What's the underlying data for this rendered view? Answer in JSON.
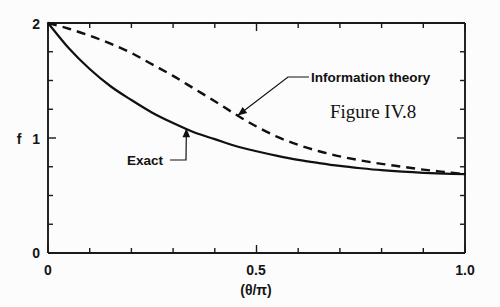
{
  "figure": {
    "caption": "Figure IV.8",
    "background_color": "#fcfcfc",
    "ink_color": "#111111"
  },
  "chart_data": {
    "type": "line",
    "title": "",
    "subtitle": "",
    "xlabel": "(θ/π)",
    "ylabel": "f",
    "xlim": [
      0,
      1.0
    ],
    "ylim": [
      0,
      2
    ],
    "grid": false,
    "legend_position": "inline-annotations",
    "x_ticks_major": [
      "0",
      "0.5",
      "1.0"
    ],
    "x_tick_values_major": [
      0,
      0.5,
      1.0
    ],
    "x_tick_values_minor": [
      0.1,
      0.2,
      0.3,
      0.4,
      0.6,
      0.7,
      0.8,
      0.9
    ],
    "y_ticks_major": [
      "0",
      "1",
      "2"
    ],
    "y_tick_values_major": [
      0,
      1,
      2
    ],
    "y_tick_values_minor": [
      0.25,
      0.5,
      0.75,
      1.25,
      1.5,
      1.75
    ],
    "x": [
      0,
      0.05,
      0.1,
      0.15,
      0.2,
      0.25,
      0.3,
      0.35,
      0.4,
      0.45,
      0.5,
      0.55,
      0.6,
      0.65,
      0.7,
      0.75,
      0.8,
      0.85,
      0.9,
      0.95,
      1.0
    ],
    "series": [
      {
        "name": "Exact",
        "style": "solid",
        "values": [
          2.0,
          1.78,
          1.6,
          1.45,
          1.33,
          1.22,
          1.13,
          1.05,
          0.99,
          0.93,
          0.885,
          0.845,
          0.81,
          0.782,
          0.757,
          0.737,
          0.72,
          0.707,
          0.697,
          0.69,
          0.686
        ]
      },
      {
        "name": "Information theory",
        "style": "dashed",
        "values": [
          2.0,
          1.95,
          1.89,
          1.82,
          1.74,
          1.64,
          1.54,
          1.43,
          1.32,
          1.205,
          1.1,
          1.01,
          0.94,
          0.885,
          0.84,
          0.805,
          0.775,
          0.75,
          0.725,
          0.705,
          0.686
        ]
      }
    ],
    "annotations": [
      {
        "text": "Information theory",
        "label_x": 305,
        "label_y": 77,
        "anchor_x": 0.455,
        "anchor_y": 1.195
      },
      {
        "text": "Exact",
        "label_x": 127,
        "label_y": 160,
        "anchor_x": 0.332,
        "anchor_y": 1.085
      }
    ]
  }
}
